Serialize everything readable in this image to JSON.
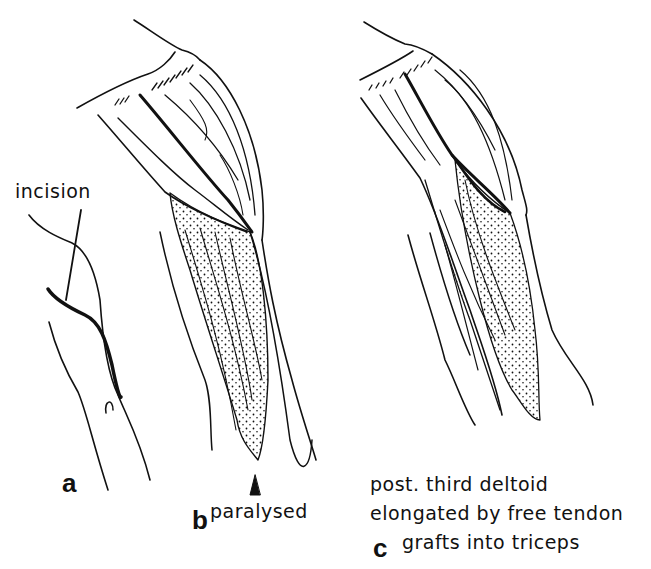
{
  "figure": {
    "panels": [
      {
        "letter": "a",
        "annotation": "incision"
      },
      {
        "letter": "b",
        "annotation": "paralysed"
      },
      {
        "letter": "c",
        "caption_lines": [
          "post. third deltoid",
          "elongated by free tendon",
          "grafts into triceps"
        ]
      }
    ],
    "colors": {
      "ink": "#111111",
      "background": "#ffffff"
    }
  }
}
